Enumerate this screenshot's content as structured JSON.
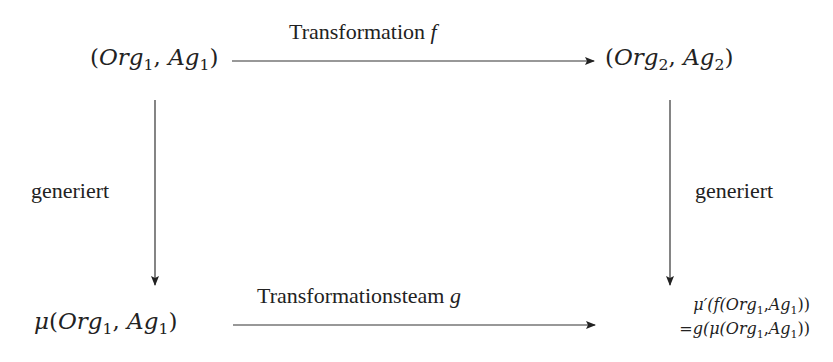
{
  "diagram": {
    "nodes": {
      "top_left": {
        "open": "(",
        "org": "Org",
        "org_sub": "1",
        "sep": ", ",
        "ag": "Ag",
        "ag_sub": "1",
        "close": ")"
      },
      "top_right": {
        "open": "(",
        "org": "Org",
        "org_sub": "2",
        "sep": ", ",
        "ag": "Ag",
        "ag_sub": "2",
        "close": ")"
      },
      "bottom_left": {
        "mu": "μ",
        "open": "(",
        "org": "Org",
        "org_sub": "1",
        "sep": ", ",
        "ag": "Ag",
        "ag_sub": "1",
        "close": ")"
      },
      "bottom_right": {
        "line1": {
          "prefix": "μ′(f(",
          "org": "Org",
          "org_sub": "1",
          "sep": ",",
          "ag": "Ag",
          "ag_sub": "1",
          "suffix": "))"
        },
        "line2": {
          "prefix": "=g(μ(",
          "org": "Org",
          "org_sub": "1",
          "sep": ",",
          "ag": "Ag",
          "ag_sub": "1",
          "suffix": "))"
        }
      }
    },
    "edges": {
      "top": {
        "label": "Transformation",
        "var": "f"
      },
      "bottom": {
        "label": "Transformationsteam",
        "var": "g"
      },
      "left": {
        "label": "generiert"
      },
      "right": {
        "label": "generiert"
      }
    }
  }
}
